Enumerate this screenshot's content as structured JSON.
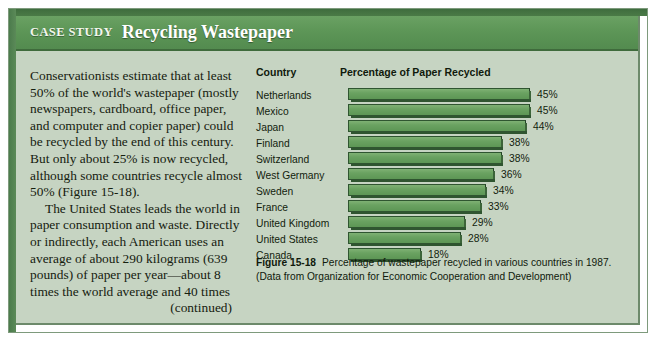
{
  "box": {
    "header": {
      "kicker": "CASE STUDY",
      "title": "Recycling Wastepaper"
    }
  },
  "article": {
    "paragraph_1": "Conservationists estimate that at least 50% of the world's wastepaper (mostly newspapers, cardboard, office paper, and computer and copier paper) could be recycled by the end of this century. But only about 25% is now recycled, although some countries recycle almost 50% (Figure 15-18).",
    "paragraph_2": "The United States leads the world in paper consumption and waste. Directly or indirectly, each American uses an average of about 290 kilograms (639 pounds) of paper per year—about 8 times the world average and 40 times",
    "continued": "(continued)"
  },
  "chart_data": {
    "type": "bar",
    "orientation": "horizontal",
    "title": "Percentage of Paper Recycled",
    "xlabel": "Percentage of Paper Recycled",
    "ylabel": "Country",
    "column_headers": [
      "Country",
      "Percentage of Paper Recycled"
    ],
    "categories": [
      "Netherlands",
      "Mexico",
      "Japan",
      "Finland",
      "Switzerland",
      "West Germany",
      "Sweden",
      "France",
      "United Kingdom",
      "United States",
      "Canada"
    ],
    "values": [
      45,
      45,
      44,
      38,
      38,
      36,
      34,
      33,
      29,
      28,
      18
    ],
    "value_labels": [
      "45%",
      "45%",
      "44%",
      "38%",
      "38%",
      "36%",
      "34%",
      "33%",
      "29%",
      "28%",
      "18%"
    ],
    "xlim": [
      0,
      45
    ],
    "grid": false,
    "legend": null,
    "bar_color": "#6aa261",
    "bar_edge_color": "#2f5530"
  },
  "figure": {
    "number": "Figure 15-18",
    "caption": "Percentage of wastepaper recycled in various countries in 1987. (Data from Organization for Economic Cooperation and Development)"
  },
  "colors": {
    "panel_bg": "#c6d4c2",
    "header_green": "#5d9657",
    "header_dark": "#3f6b3c",
    "bar_green": "#6aa261",
    "text": "#121d0d"
  }
}
